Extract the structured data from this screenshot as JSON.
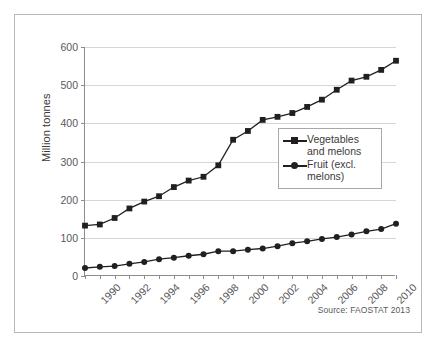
{
  "figure": {
    "source_note": "Source: FAOSTAT 2013",
    "frame_color": "#b9b9b9",
    "series_color": "#231f20",
    "grid_color": "#d6d6d6"
  },
  "legend": {
    "position": "inside-right-middle",
    "entries": [
      {
        "label": "Vegetables\nand melons",
        "marker": "square",
        "marker_icon": "square-marker-icon"
      },
      {
        "label": "Fruit (excl.\nmelons)",
        "marker": "circle",
        "marker_icon": "circle-marker-icon"
      }
    ]
  },
  "chart_data": {
    "type": "line",
    "title": "",
    "subtitle": "",
    "xlabel": "",
    "ylabel": "Million tonnes",
    "xlim": [
      1990,
      2011
    ],
    "ylim": [
      0,
      600
    ],
    "yticks": [
      0,
      100,
      200,
      300,
      400,
      500,
      600
    ],
    "ytick_labels": [
      "0",
      "100",
      "200",
      "300",
      "400",
      "500",
      "600"
    ],
    "xticks": [
      1990,
      1992,
      1994,
      1996,
      1998,
      2000,
      2002,
      2004,
      2006,
      2008,
      2010
    ],
    "xtick_labels": [
      "1990",
      "1992",
      "1994",
      "1996",
      "1998",
      "2000",
      "2002",
      "2004",
      "2006",
      "2008",
      "2010"
    ],
    "xtick_rotation": -45,
    "grid": "horizontal",
    "legend_position": "inside-right-middle",
    "annotations": [
      "Source: FAOSTAT 2013"
    ],
    "x": [
      1990,
      1991,
      1992,
      1993,
      1994,
      1995,
      1996,
      1997,
      1998,
      1999,
      2000,
      2001,
      2002,
      2003,
      2004,
      2005,
      2006,
      2007,
      2008,
      2009,
      2010,
      2011
    ],
    "series": [
      {
        "name": "Vegetables and melons",
        "marker": "square",
        "values": [
          132,
          135,
          152,
          177,
          195,
          209,
          233,
          250,
          260,
          290,
          357,
          380,
          409,
          417,
          427,
          443,
          462,
          488,
          512,
          522,
          540,
          564
        ]
      },
      {
        "name": "Fruit (excl. melons)",
        "marker": "circle",
        "values": [
          21,
          24,
          26,
          32,
          37,
          44,
          48,
          53,
          57,
          65,
          65,
          69,
          72,
          78,
          86,
          91,
          97,
          102,
          109,
          117,
          123,
          137
        ]
      }
    ]
  }
}
